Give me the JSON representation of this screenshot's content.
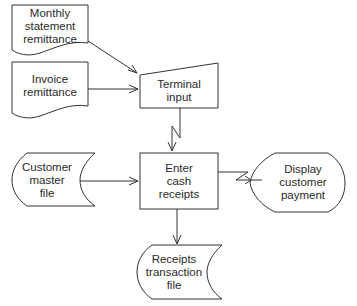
{
  "diagram": {
    "type": "system flowchart",
    "nodes": {
      "monthly_statement": {
        "shape": "document",
        "lines": [
          "Monthly",
          "statement",
          "remittance"
        ]
      },
      "invoice": {
        "shape": "document",
        "lines": [
          "Invoice",
          "remittance"
        ]
      },
      "terminal_input": {
        "shape": "manual-input",
        "lines": [
          "Terminal",
          "input"
        ]
      },
      "enter_cash": {
        "shape": "process",
        "lines": [
          "Enter",
          "cash",
          "receipts"
        ]
      },
      "customer_master": {
        "shape": "online-storage",
        "lines": [
          "Customer",
          "master",
          "file"
        ]
      },
      "display_payment": {
        "shape": "display",
        "lines": [
          "Display",
          "customer",
          "payment"
        ]
      },
      "receipts_file": {
        "shape": "online-storage",
        "lines": [
          "Receipts",
          "transaction",
          "file"
        ]
      }
    },
    "edges": [
      {
        "from": "Monthly statement remittance",
        "to": "Terminal input",
        "style": "arrow"
      },
      {
        "from": "Invoice remittance",
        "to": "Terminal input",
        "style": "arrow"
      },
      {
        "from": "Terminal input",
        "to": "Enter cash receipts",
        "style": "communication-link"
      },
      {
        "from": "Customer master file",
        "to": "Enter cash receipts",
        "style": "arrow"
      },
      {
        "from": "Enter cash receipts",
        "to": "Display customer payment",
        "style": "communication-link"
      },
      {
        "from": "Enter cash receipts",
        "to": "Receipts transaction file",
        "style": "arrow"
      }
    ],
    "colors": {
      "stroke": "#333333",
      "background": "#ffffff",
      "text": "#2a2a2a"
    }
  }
}
